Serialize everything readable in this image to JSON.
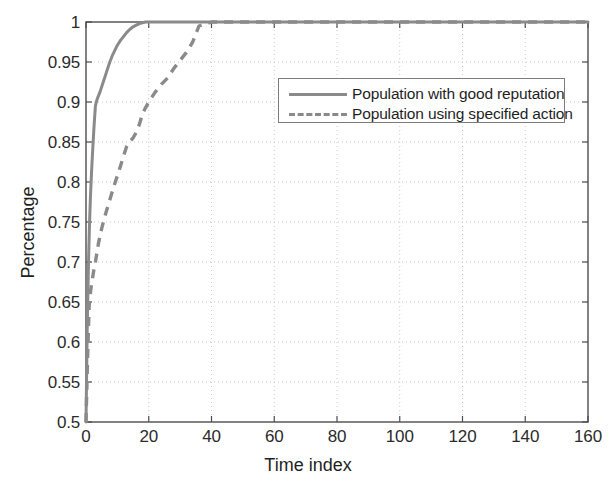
{
  "chart_data": {
    "type": "line",
    "title": "",
    "xlabel": "Time index",
    "ylabel": "Percentage",
    "xlim": [
      0,
      160
    ],
    "ylim": [
      0.5,
      1
    ],
    "xticks": [
      "0",
      "20",
      "40",
      "60",
      "80",
      "100",
      "120",
      "140",
      "160"
    ],
    "yticks": [
      "0.5",
      "0.55",
      "0.6",
      "0.65",
      "0.7",
      "0.75",
      "0.8",
      "0.85",
      "0.9",
      "0.95",
      "1"
    ],
    "grid": "dotted",
    "legend_position": "upper-center-right",
    "line_color": "#8a8a8a",
    "series": [
      {
        "name": "Population with good reputation",
        "style": "solid",
        "color": "#8a8a8a",
        "x": [
          0,
          0.4,
          0.8,
          1.1,
          1.4,
          1.8,
          2.2,
          2.6,
          3.0,
          3.5,
          4.0,
          4.5,
          5.0,
          5.5,
          6.0,
          6.5,
          7.0,
          7.5,
          8.0,
          8.5,
          9.0,
          9.5,
          10.0,
          11.0,
          12.0,
          13.0,
          14.0,
          15.0,
          16.0,
          17.0,
          18.0,
          19.0,
          20.0,
          30.0,
          50.0,
          80.0,
          120.0,
          160.0
        ],
        "y": [
          0.5,
          0.62,
          0.7,
          0.745,
          0.78,
          0.815,
          0.845,
          0.872,
          0.895,
          0.903,
          0.908,
          0.913,
          0.919,
          0.925,
          0.931,
          0.937,
          0.943,
          0.949,
          0.954,
          0.959,
          0.963,
          0.967,
          0.971,
          0.977,
          0.982,
          0.987,
          0.991,
          0.994,
          0.996,
          0.998,
          0.999,
          1.0,
          1.0,
          1.0,
          1.0,
          1.0,
          1.0,
          1.0
        ]
      },
      {
        "name": "Population using specified action",
        "style": "dashed",
        "color": "#8a8a8a",
        "x": [
          0,
          0.5,
          1.0,
          1.5,
          2.0,
          2.5,
          3.0,
          3.5,
          4.0,
          5.0,
          6.0,
          7.0,
          8.0,
          9.0,
          10.0,
          11.0,
          12.0,
          13.0,
          14.0,
          15.0,
          16.0,
          17.0,
          18.0,
          19.0,
          20.0,
          22.0,
          24.0,
          26.0,
          28.0,
          30.0,
          32.0,
          34.0,
          36.0,
          40.0,
          60.0,
          100.0,
          140.0,
          160.0
        ],
        "y": [
          0.5,
          0.58,
          0.645,
          0.665,
          0.678,
          0.69,
          0.7,
          0.712,
          0.724,
          0.742,
          0.757,
          0.77,
          0.783,
          0.796,
          0.808,
          0.82,
          0.833,
          0.845,
          0.851,
          0.855,
          0.862,
          0.872,
          0.885,
          0.893,
          0.9,
          0.912,
          0.922,
          0.93,
          0.942,
          0.952,
          0.962,
          0.975,
          0.995,
          1.0,
          1.0,
          1.0,
          1.0,
          1.0
        ]
      }
    ]
  },
  "legend": {
    "items": [
      {
        "label": "Population with good reputation",
        "style": "solid"
      },
      {
        "label": "Population using specified action",
        "style": "dashed"
      }
    ]
  }
}
